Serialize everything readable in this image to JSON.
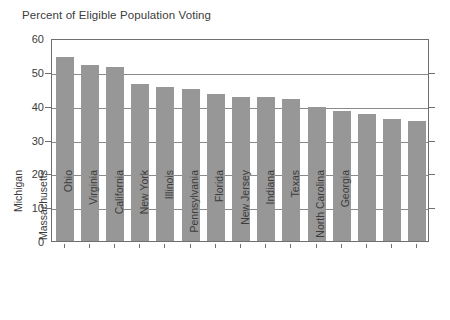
{
  "chart_data": {
    "type": "bar",
    "title": "Percent of Eligible Population Voting",
    "xlabel": "",
    "ylabel": "",
    "ylim": [
      0,
      60
    ],
    "yticks": [
      0,
      10,
      20,
      30,
      40,
      50,
      60
    ],
    "grid": true,
    "legend": false,
    "bar_color": "#979797",
    "categories": [
      "Missouri",
      "Michigan",
      "Massachusetts",
      "Ohio",
      "Virginia",
      "California",
      "New York",
      "Illinois",
      "Pennsylvania",
      "Florida",
      "New Jersey",
      "Indiana",
      "Texas",
      "North Carolina",
      "Georgia"
    ],
    "values": [
      54.5,
      52,
      51.5,
      46.5,
      45.5,
      45,
      43.5,
      42.5,
      42.5,
      42,
      39.5,
      38.5,
      37.5,
      36,
      35.5
    ]
  }
}
